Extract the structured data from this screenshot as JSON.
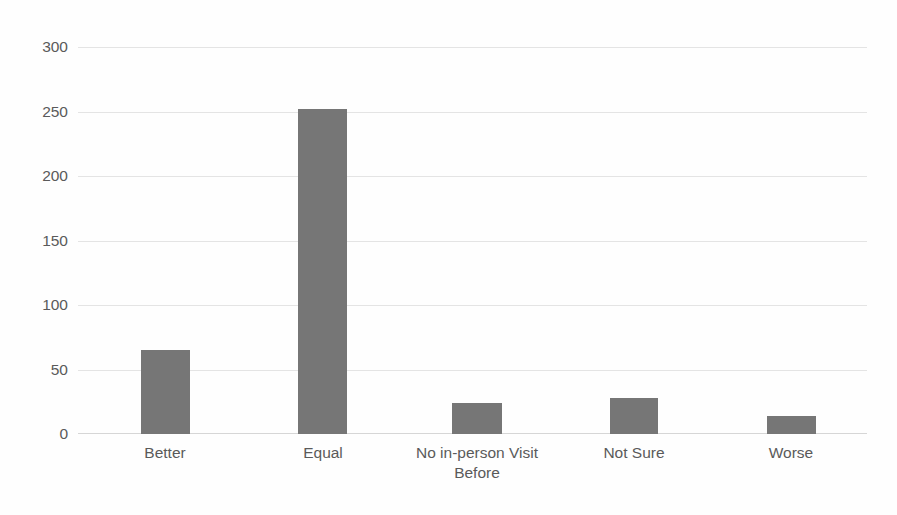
{
  "chart_data": {
    "type": "bar",
    "title": "",
    "subtitle": "",
    "xlabel": "",
    "ylabel": "",
    "categories": [
      "Better",
      "Equal",
      "No in-person Visit Before",
      "Not Sure",
      "Worse"
    ],
    "values": [
      65,
      252,
      24,
      28,
      14
    ],
    "ylim": [
      0,
      300
    ],
    "ytick_labels": [
      "0",
      "50",
      "100",
      "150",
      "200",
      "250",
      "300"
    ],
    "ytick_values": [
      0,
      50,
      100,
      150,
      200,
      250,
      300
    ],
    "grid": true,
    "grid_axis": "y",
    "legend": false,
    "legend_position": "none",
    "series": [
      {
        "name": "",
        "values": [
          65,
          252,
          24,
          28,
          14
        ]
      }
    ],
    "colors": {
      "bar": "#767676",
      "gridline": "#e4e4e4",
      "axis": "#d6d6d6",
      "tick_label": "#5a5a5a",
      "background": "#fefefe"
    }
  },
  "axes": {
    "y": {
      "ticks": [
        {
          "label": "300",
          "value": 300
        },
        {
          "label": "250",
          "value": 250
        },
        {
          "label": "200",
          "value": 200
        },
        {
          "label": "150",
          "value": 150
        },
        {
          "label": "100",
          "value": 100
        },
        {
          "label": "50",
          "value": 50
        },
        {
          "label": "0",
          "value": 0
        }
      ]
    },
    "x": {
      "ticks": [
        {
          "label": "Better"
        },
        {
          "label": "Equal"
        },
        {
          "label": "No in-person Visit\nBefore"
        },
        {
          "label": "Not Sure"
        },
        {
          "label": "Worse"
        }
      ]
    }
  }
}
